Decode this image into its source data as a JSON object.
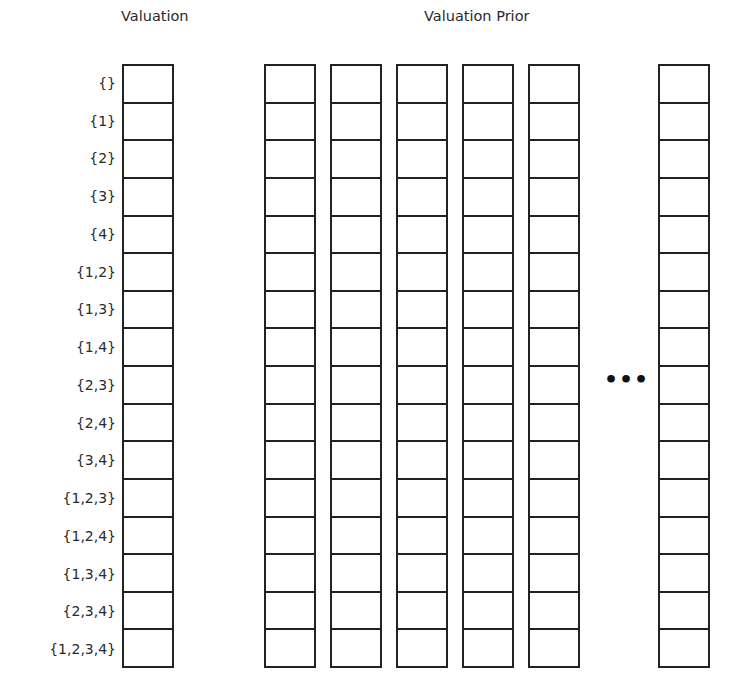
{
  "valuation": {
    "title": "Valuation",
    "row_labels": [
      "{}",
      "{1}",
      "{2}",
      "{3}",
      "{4}",
      "{1,2}",
      "{1,3}",
      "{1,4}",
      "{2,3}",
      "{2,4}",
      "{3,4}",
      "{1,2,3}",
      "{1,2,4}",
      "{1,3,4}",
      "{2,3,4}",
      "{1,2,3,4}"
    ]
  },
  "prior": {
    "title": "Valuation Prior",
    "visible_columns_before_ellipsis": 5,
    "ellipsis": "•••",
    "visible_columns_after_ellipsis": 1
  },
  "rows": 16
}
